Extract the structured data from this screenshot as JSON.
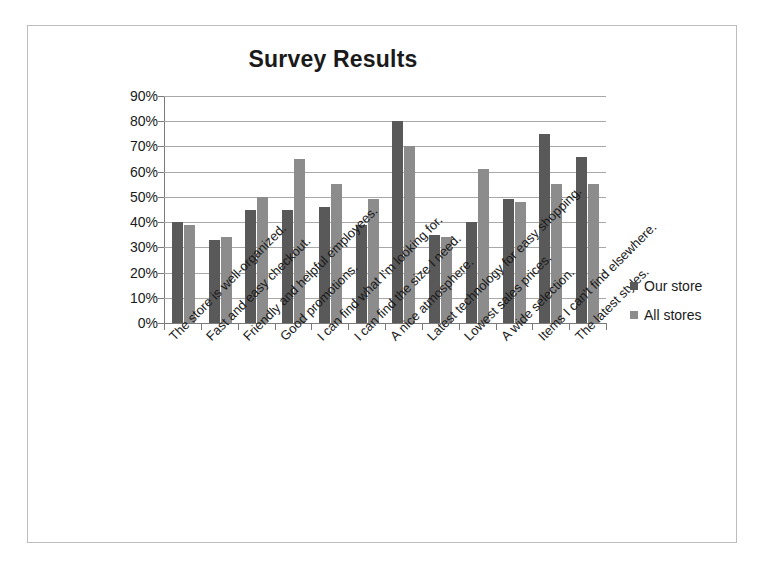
{
  "chart_data": {
    "type": "bar",
    "title": "Survey Results",
    "xlabel": "",
    "ylabel": "",
    "ylim": [
      0,
      90
    ],
    "ytick_labels": [
      "90%",
      "80%",
      "70%",
      "60%",
      "50%",
      "40%",
      "30%",
      "20%",
      "10%",
      "0%"
    ],
    "ytick_values": [
      90,
      80,
      70,
      60,
      50,
      40,
      30,
      20,
      10,
      0
    ],
    "grid": true,
    "legend_position": "right",
    "categories": [
      "The store is well-organized.",
      "Fast and easy checkout.",
      "Friendly and helpful employees.",
      "Good promotions.",
      "I can find what I'm looking for.",
      "I can find the size I need.",
      "A nice atmosphere.",
      "Latest technology for easy shopping.",
      "Lowest sales prices.",
      "A wide selection.",
      "Items I can't find elsewhere.",
      "The latest styles."
    ],
    "series": [
      {
        "name": "Our store",
        "color": "#595959",
        "values": [
          40,
          33,
          45,
          45,
          46,
          39,
          80,
          35,
          40,
          49,
          75,
          66
        ]
      },
      {
        "name": "All stores",
        "color": "#8c8c8c",
        "values": [
          39,
          34,
          50,
          65,
          55,
          49,
          70,
          34,
          61,
          48,
          55,
          55
        ]
      }
    ]
  }
}
